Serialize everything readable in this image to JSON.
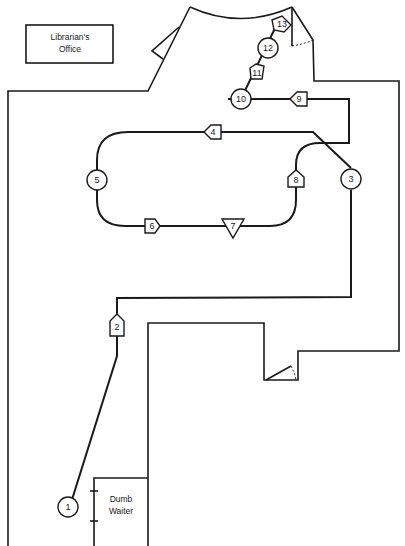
{
  "diagram": {
    "type": "floor-plan-flow-process",
    "rooms": [
      {
        "id": "librarians-office",
        "label_line1": "Librarian's",
        "label_line2": "Office"
      },
      {
        "id": "dumb-waiter",
        "label_line1": "Dumb",
        "label_line2": "Waiter"
      }
    ],
    "steps": [
      {
        "n": "1",
        "symbol": "circle",
        "meaning": "operation"
      },
      {
        "n": "2",
        "symbol": "arrow-up",
        "meaning": "transport"
      },
      {
        "n": "3",
        "symbol": "circle",
        "meaning": "operation"
      },
      {
        "n": "4",
        "symbol": "arrow-left",
        "meaning": "transport"
      },
      {
        "n": "5",
        "symbol": "circle",
        "meaning": "operation"
      },
      {
        "n": "6",
        "symbol": "arrow-right",
        "meaning": "transport"
      },
      {
        "n": "7",
        "symbol": "triangle-down",
        "meaning": "storage"
      },
      {
        "n": "8",
        "symbol": "arrow-up",
        "meaning": "transport"
      },
      {
        "n": "9",
        "symbol": "arrow-left",
        "meaning": "transport"
      },
      {
        "n": "10",
        "symbol": "circle",
        "meaning": "operation"
      },
      {
        "n": "11",
        "symbol": "arrow-up-right",
        "meaning": "transport"
      },
      {
        "n": "12",
        "symbol": "circle",
        "meaning": "operation"
      },
      {
        "n": "13",
        "symbol": "arrow-up-right",
        "meaning": "transport"
      }
    ]
  }
}
